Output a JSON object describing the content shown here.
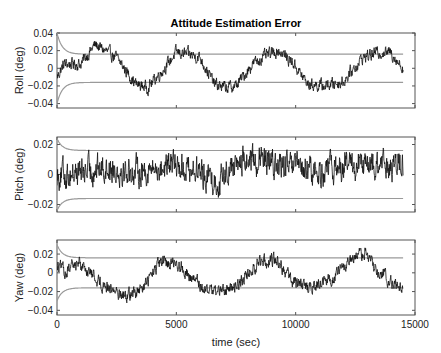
{
  "chart_data": {
    "type": "line",
    "title": "Attitude Estimation Error",
    "xlabel": "time (sec)",
    "xlim": [
      0,
      15000
    ],
    "xticks": [
      0,
      5000,
      10000,
      15000
    ],
    "xtick_labels": [
      "0",
      "5000",
      "10000",
      "15000"
    ],
    "data_end_time": 14500,
    "grid": false,
    "legend": null,
    "colors": {
      "error": "#111111",
      "bound": "#9a9a9a",
      "axes": "#555555"
    },
    "subplots": [
      {
        "name": "roll",
        "ylabel": "Roll (deg)",
        "ylim": [
          -0.045,
          0.04
        ],
        "yticks": [
          0.04,
          0.02,
          0,
          -0.02,
          -0.04
        ],
        "ytick_labels": [
          "0.04",
          "0.02",
          "0",
          "−0.02",
          "−0.04"
        ],
        "bound_3sigma": {
          "steady": 0.016,
          "initial": 0.04
        },
        "trend": {
          "t": [
            0,
            300,
            1000,
            1600,
            2500,
            3300,
            3800,
            4500,
            5000,
            5500,
            6000,
            6600,
            7100,
            7500,
            8200,
            8800,
            9300,
            9900,
            10500,
            11200,
            12000,
            12800,
            13400,
            14000,
            14500
          ],
          "v": [
            -0.01,
            0.005,
            0.005,
            0.027,
            0.012,
            -0.018,
            -0.022,
            0.0,
            0.018,
            0.016,
            0.012,
            -0.018,
            -0.022,
            -0.02,
            0.005,
            0.015,
            0.02,
            0.006,
            -0.018,
            -0.02,
            -0.015,
            0.012,
            0.018,
            0.018,
            0.0
          ]
        },
        "noise_amplitude": 0.0055
      },
      {
        "name": "pitch",
        "ylabel": "Pitch (deg)",
        "ylim": [
          -0.025,
          0.025
        ],
        "yticks": [
          0.02,
          0,
          -0.02
        ],
        "ytick_labels": [
          "0.02",
          "0",
          "−0.02"
        ],
        "bound_3sigma": {
          "steady": 0.016,
          "initial": 0.024
        },
        "trend": {
          "t": [
            0,
            1000,
            2000,
            3000,
            4000,
            5000,
            6000,
            6800,
            7200,
            8000,
            9300,
            10000,
            11000,
            12000,
            13000,
            14500
          ],
          "v": [
            0.0,
            0.002,
            0.005,
            0.002,
            0.003,
            0.007,
            0.002,
            -0.006,
            0.005,
            0.01,
            0.006,
            0.004,
            0.001,
            0.006,
            0.005,
            0.006
          ]
        },
        "noise_amplitude": 0.0075
      },
      {
        "name": "yaw",
        "ylabel": "Yaw (deg)",
        "ylim": [
          -0.045,
          0.035
        ],
        "yticks": [
          0.02,
          0,
          -0.02,
          -0.04
        ],
        "ytick_labels": [
          "0.02",
          "0",
          "−0.02",
          "−0.04"
        ],
        "bound_3sigma": {
          "steady": 0.016,
          "initial": 0.03
        },
        "trend": {
          "t": [
            0,
            400,
            900,
            1800,
            2800,
            3500,
            4300,
            5000,
            5600,
            6300,
            7000,
            7700,
            8500,
            9200,
            9800,
            10500,
            11300,
            12000,
            12900,
            13500,
            14500
          ],
          "v": [
            0.008,
            0.0,
            0.012,
            -0.01,
            -0.024,
            -0.02,
            0.01,
            0.012,
            -0.005,
            -0.018,
            -0.02,
            -0.01,
            0.012,
            0.015,
            -0.008,
            -0.016,
            -0.01,
            0.005,
            0.022,
            0.0,
            -0.018
          ]
        },
        "noise_amplitude": 0.0055
      }
    ]
  }
}
